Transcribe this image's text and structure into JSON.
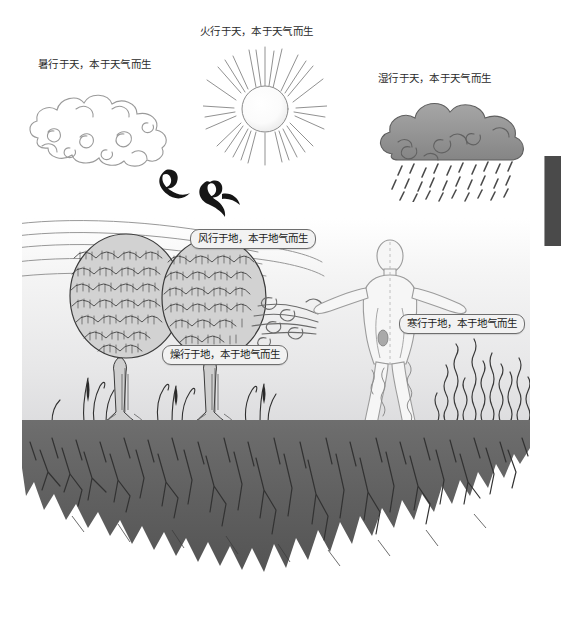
{
  "figure": {
    "sky_labels": [
      {
        "id": "heat",
        "text": "暑行于天，本于天气而生"
      },
      {
        "id": "fire",
        "text": "火行于天，本于天气而生"
      },
      {
        "id": "damp",
        "text": "湿行于天，本于天气而生"
      }
    ],
    "earth_callouts": [
      {
        "id": "wind",
        "text": "风行于地，本于地气而生"
      },
      {
        "id": "cold",
        "text": "寒行于地，本于地气而生"
      },
      {
        "id": "dry",
        "text": "燥行于地，本于地气而生"
      }
    ],
    "elements": {
      "cloud_white": "auspicious-cloud-outline",
      "sun": "radiant-sun",
      "cloud_rain": "rain-cloud",
      "birds": "two-flying-birds",
      "trees": "two-round-canopy-trees",
      "person": "standing-human-figure-arms-out",
      "reeds": "wavy-grass-reeds",
      "ground": "jagged-earth-mass"
    },
    "colors": {
      "ink": "#2a2a2a",
      "ground_dark": "#5f5f5f",
      "ground_light": "#7b7b7b",
      "cloud_gray": "#8f8f8f",
      "sky_top": "#ffffff",
      "sky_bottom": "#dcdcde",
      "callout_fill": "#f2f2f2",
      "edge_tab": "#4a4a4a"
    }
  }
}
